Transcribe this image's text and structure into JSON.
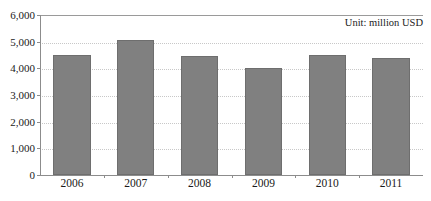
{
  "chart_data": {
    "type": "bar",
    "title": "",
    "subtitle": "",
    "annotation": "Unit: million USD",
    "xlabel": "",
    "ylabel": "",
    "categories": [
      "2006",
      "2007",
      "2008",
      "2009",
      "2010",
      "2011"
    ],
    "values": [
      4500,
      5050,
      4480,
      4010,
      4490,
      4390
    ],
    "ylim": [
      0,
      6000
    ],
    "ytick_values": [
      0,
      1000,
      2000,
      3000,
      4000,
      5000,
      6000
    ],
    "ytick_labels": [
      "0",
      "1,000",
      "2,000",
      "3,000",
      "4,000",
      "5,000",
      "6,000"
    ],
    "grid": true,
    "grid_axis": "y",
    "grid_style": "dotted",
    "legend": null,
    "legend_position": "none",
    "series": [
      {
        "name": "value",
        "values": [
          4500,
          5050,
          4480,
          4010,
          4490,
          4390
        ]
      }
    ]
  },
  "colors": {
    "bar_fill": "#808080",
    "bar_border": "#6e6e6e",
    "gridline": "#c8c8c8",
    "axis": "#8c8c8c",
    "text": "#1a1a1a",
    "background": "#ffffff"
  }
}
